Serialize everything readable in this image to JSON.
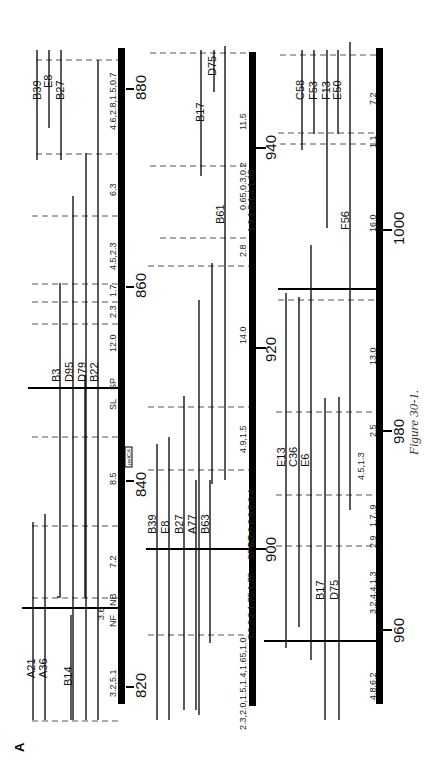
{
  "figure": {
    "panel_label": "A",
    "caption": "Figure 30-1.",
    "gene_label": "pelCA",
    "rows": [
      {
        "coords": [
          "820",
          "840",
          "860",
          "880"
        ],
        "sites": [
          "NF",
          "NB",
          "SL",
          "SP"
        ],
        "distances": [
          "3.2,5.1",
          "3.6",
          "7.2",
          "8.5",
          "12.0",
          "2.3",
          "1.7",
          "4.5,2.3",
          "6.3",
          "4.6,2.8,1.5,0.7"
        ],
        "strains": [
          "A21",
          "A36",
          "B14",
          "B3",
          "D95",
          "D79",
          "B22",
          "B39",
          "E8",
          "B27"
        ]
      },
      {
        "coords": [
          "900",
          "920",
          "940"
        ],
        "sites": [
          "SP",
          "SO"
        ],
        "distances": [
          "2.3,2.0,1.5,1.4,1.65,1.0",
          "3.2,2.2,1.75,1.75",
          "6.2,0.6,0.8,0.4",
          "4.9,1.5",
          "14.0",
          "2.8",
          "1.9,1.5,1.4,1.05",
          "0.65,0.3,0.2",
          "11.5"
        ],
        "strains": [
          "B39",
          "E8",
          "B27",
          "A77",
          "B63",
          "B61",
          "B17",
          "D75"
        ]
      },
      {
        "coords": [
          "960",
          "980",
          "1000"
        ],
        "sites": [
          "SO",
          "S",
          "S",
          "SI"
        ],
        "distances": [
          "4.8,6.2",
          "3.2,4.4,1.3",
          "2.9",
          "1.7,.9",
          "4.5,1.3",
          "2.5",
          "13.0",
          "16.0",
          "1.1",
          "7.2"
        ],
        "strains": [
          "B17",
          "D75",
          "E13",
          "C36",
          "E6",
          "F56",
          "C58",
          "F53",
          "F13",
          "E50"
        ]
      }
    ]
  }
}
